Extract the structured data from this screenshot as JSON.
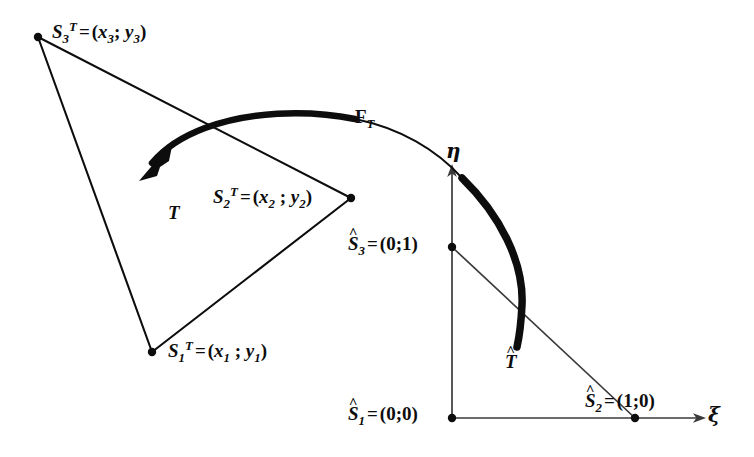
{
  "figure": {
    "background_color": "#ffffff",
    "stroke_color": "#0d0d0d",
    "width": 754,
    "height": 457
  },
  "physical_triangle": {
    "region_label": "T",
    "vertices": [
      {
        "id": "S1T",
        "label_S": "S",
        "label_sup": "T",
        "label_sub": "1",
        "eq": "=",
        "coords": "(x₁ ; y₁)",
        "x": 152,
        "y": 352
      },
      {
        "id": "S2T",
        "label_S": "S",
        "label_sup": "T",
        "label_sub": "2",
        "eq": "=",
        "coords": "(x₂ ; y₂)",
        "x": 351,
        "y": 198
      },
      {
        "id": "S3T",
        "label_S": "S",
        "label_sup": "T",
        "label_sub": "3",
        "eq": "=",
        "coords": "(x₃; y₃)",
        "x": 38,
        "y": 37
      }
    ]
  },
  "reference_triangle": {
    "region_label": "T",
    "region_label_hat": "^",
    "vertices": [
      {
        "id": "S1hat",
        "label_S": "S",
        "label_sub": "1",
        "hat": "^",
        "eq": "=",
        "coords": "(0;0)",
        "x": 452,
        "y": 418
      },
      {
        "id": "S2hat",
        "label_S": "S",
        "label_sub": "2",
        "hat": "^",
        "eq": "=",
        "coords": "(1;0)",
        "x": 635,
        "y": 418
      },
      {
        "id": "S3hat",
        "label_S": "S",
        "label_sub": "3",
        "hat": "^",
        "eq": "=",
        "coords": "(0;1)",
        "x": 452,
        "y": 247
      }
    ]
  },
  "axes": {
    "xi_label": "ξ",
    "eta_label": "η",
    "origin": {
      "x": 452,
      "y": 418
    }
  },
  "mapping": {
    "name_main": "F",
    "name_sub": "T",
    "direction": "reference-to-physical",
    "arrow_tip": {
      "x": 146,
      "y": 172
    }
  }
}
